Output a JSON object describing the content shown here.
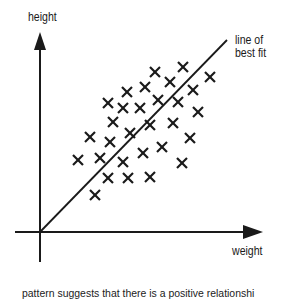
{
  "diagram": {
    "y_axis_label": "height",
    "x_axis_label": "weight",
    "fit_line_label": [
      "line of",
      "best fit"
    ],
    "caption": "pattern suggests that there is a positive relationshi",
    "marker_symbol": "cross",
    "line_color": "#1a1a1a"
  },
  "chart_data": {
    "type": "scatter",
    "title": "",
    "xlabel": "weight",
    "ylabel": "height",
    "annotations": [
      "line of best fit"
    ],
    "grid": false,
    "trendline": {
      "from": [
        0,
        0
      ],
      "to": [
        187,
        192
      ],
      "label": "line of best fit"
    },
    "points_px": [
      [
        155,
        72
      ],
      [
        183,
        67
      ],
      [
        170,
        82
      ],
      [
        210,
        77
      ],
      [
        127,
        92
      ],
      [
        145,
        87
      ],
      [
        193,
        90
      ],
      [
        108,
        103
      ],
      [
        123,
        108
      ],
      [
        140,
        108
      ],
      [
        158,
        100
      ],
      [
        178,
        102
      ],
      [
        198,
        112
      ],
      [
        113,
        122
      ],
      [
        150,
        125
      ],
      [
        173,
        123
      ],
      [
        90,
        137
      ],
      [
        110,
        142
      ],
      [
        130,
        133
      ],
      [
        190,
        138
      ],
      [
        143,
        153
      ],
      [
        162,
        147
      ],
      [
        78,
        160
      ],
      [
        100,
        158
      ],
      [
        123,
        162
      ],
      [
        182,
        163
      ],
      [
        108,
        178
      ],
      [
        128,
        178
      ],
      [
        150,
        177
      ],
      [
        95,
        195
      ]
    ]
  }
}
